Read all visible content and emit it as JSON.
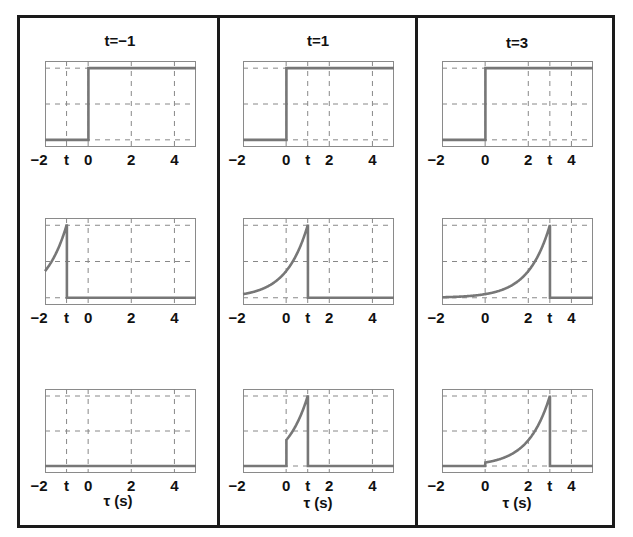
{
  "chart_data": {
    "type": "line",
    "columns": [
      {
        "title": "t=−1",
        "t": -1
      },
      {
        "title": "t=1",
        "t": 1
      },
      {
        "title": "t=3",
        "t": 3
      }
    ],
    "rows": [
      "step input x(τ)",
      "flipped shifted kernel h(t−τ)",
      "product x(τ)h(t−τ)"
    ],
    "xlim": [
      -2,
      5
    ],
    "ylim": [
      -0.1,
      1.1
    ],
    "xticks": [
      -2,
      0,
      2,
      4
    ],
    "xlabel": "τ (s)",
    "grid": true,
    "line_color": "#777777",
    "decay_rate": 1.0
  },
  "panels": {
    "col0": {
      "title": "t=−1",
      "ticks": [
        "−2",
        "t",
        "0",
        "2",
        "4"
      ],
      "tick_vals": [
        -2,
        -1,
        0,
        2,
        4
      ]
    },
    "col1": {
      "title": "t=1",
      "ticks": [
        "−2",
        "0",
        "t",
        "2",
        "4"
      ],
      "tick_vals": [
        -2,
        0,
        1,
        2,
        4
      ]
    },
    "col2": {
      "title": "t=3",
      "ticks": [
        "−2",
        "0",
        "2",
        "t",
        "4"
      ],
      "tick_vals": [
        -2,
        0,
        2,
        3,
        4
      ]
    }
  },
  "xlabel": "τ (s)"
}
